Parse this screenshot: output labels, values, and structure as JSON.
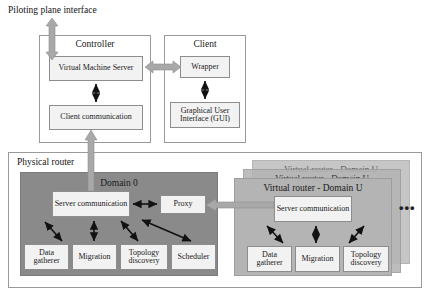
{
  "figure": {
    "top_label": "Piloting plane interface",
    "bottom_caption": ""
  },
  "controller": {
    "title": "Controller",
    "nodes": [
      {
        "label": "Virtual Machine Server"
      },
      {
        "label": "Client communication"
      }
    ]
  },
  "client": {
    "title": "Client",
    "nodes": [
      {
        "label": "Wrapper"
      },
      {
        "label": "Graphical User Interface (GUI)"
      }
    ]
  },
  "physical_router": {
    "title": "Physical router",
    "domain0": {
      "title": "Domain 0",
      "server_communication": "Server communication",
      "proxy": "Proxy",
      "modules": [
        {
          "label": "Data gatherer"
        },
        {
          "label": "Migration"
        },
        {
          "label": "Topology discovery"
        },
        {
          "label": "Scheduler"
        }
      ]
    },
    "virtual_routers": {
      "title": "Virtual router - Domain U",
      "stack_count": 3,
      "server_communication": "Server communication",
      "modules": [
        {
          "label": "Data gatherer"
        },
        {
          "label": "Migration"
        },
        {
          "label": "Topology discovery"
        }
      ],
      "more_indicator": "•••"
    }
  },
  "colors": {
    "panel_dark": "#8a8a8a",
    "panel_mid": "#b4b4b4",
    "node_fill": "#f2f2f2",
    "arrow_thick": "#9e9e9e",
    "arrow_thin": "#111111",
    "border": "#8d8d8d"
  }
}
